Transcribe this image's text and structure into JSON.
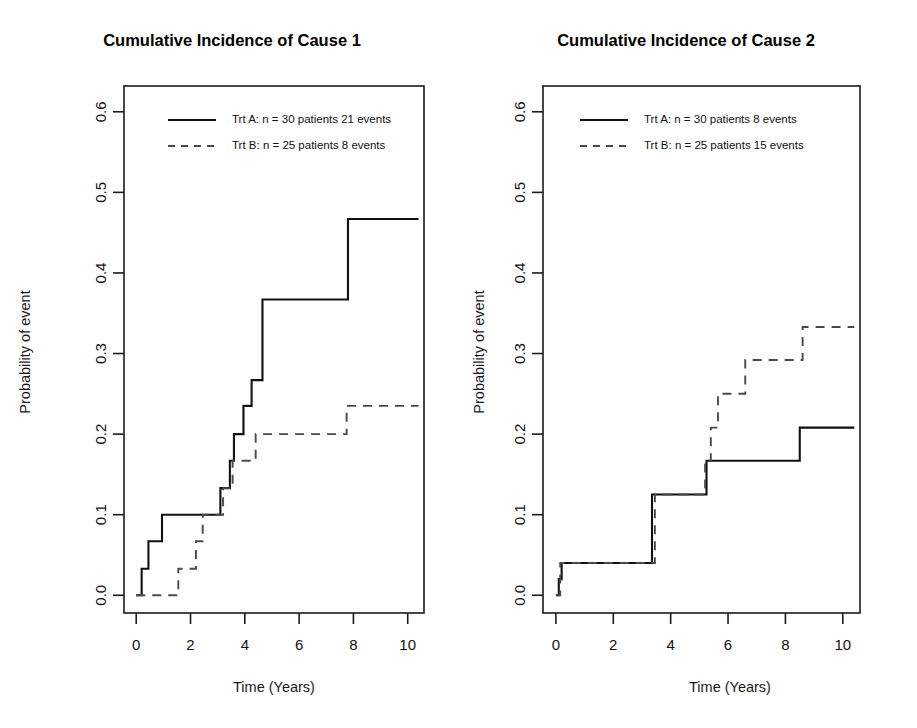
{
  "figure": {
    "width": 917,
    "height": 728,
    "background": "#ffffff",
    "ink_color": "#111111",
    "dashed_color": "#4a4a4a"
  },
  "chart_data": [
    {
      "type": "line",
      "step": "hv",
      "panel": "left",
      "title": "Cumulative Incidence of Cause 1",
      "xlabel": "Time (Years)",
      "ylabel": "Probability of event",
      "xlim": [
        -0.45,
        10.6
      ],
      "ylim": [
        -0.022,
        0.632
      ],
      "xticks": [
        0,
        2,
        4,
        6,
        8,
        10
      ],
      "xticklabels": [
        "0",
        "2",
        "4",
        "6",
        "8",
        "10"
      ],
      "yticks": [
        0.0,
        0.1,
        0.2,
        0.3,
        0.4,
        0.5,
        0.6
      ],
      "yticklabels": [
        "0.0",
        "0.1",
        "0.2",
        "0.3",
        "0.4",
        "0.5",
        "0.6"
      ],
      "grid": false,
      "legend_position": "top-left",
      "series": [
        {
          "name": "Trt A",
          "label": "Trt A: n = 30 patients 21 events",
          "style": "solid",
          "x": [
            0.0,
            0.2,
            0.45,
            0.95,
            2.45,
            3.1,
            3.45,
            3.6,
            3.95,
            4.25,
            4.65,
            7.55,
            7.8,
            10.4
          ],
          "y": [
            0.0,
            0.033,
            0.067,
            0.1,
            0.1,
            0.133,
            0.167,
            0.2,
            0.235,
            0.267,
            0.367,
            0.367,
            0.467,
            0.467
          ]
        },
        {
          "name": "Trt B",
          "label": "Trt B: n = 25 patients 8 events",
          "style": "dashed",
          "x": [
            0.0,
            1.2,
            1.55,
            2.2,
            2.45,
            3.2,
            3.55,
            4.4,
            7.75,
            10.4
          ],
          "y": [
            0.0,
            0.0,
            0.033,
            0.067,
            0.1,
            0.133,
            0.167,
            0.2,
            0.235,
            0.235
          ]
        }
      ]
    },
    {
      "type": "line",
      "step": "hv",
      "panel": "right",
      "title": "Cumulative Incidence of Cause 2",
      "xlabel": "Time (Years)",
      "ylabel": "Probability of event",
      "xlim": [
        -0.45,
        10.6
      ],
      "ylim": [
        -0.022,
        0.632
      ],
      "xticks": [
        0,
        2,
        4,
        6,
        8,
        10
      ],
      "xticklabels": [
        "0",
        "2",
        "4",
        "6",
        "8",
        "10"
      ],
      "yticks": [
        0.0,
        0.1,
        0.2,
        0.3,
        0.4,
        0.5,
        0.6
      ],
      "yticklabels": [
        "0.0",
        "0.1",
        "0.2",
        "0.3",
        "0.4",
        "0.5",
        "0.6"
      ],
      "grid": false,
      "legend_position": "top-left",
      "series": [
        {
          "name": "Trt A",
          "label": "Trt A: n = 30 patients 8 events",
          "style": "solid",
          "x": [
            0.0,
            0.1,
            0.2,
            3.2,
            3.35,
            5.25,
            8.5,
            10.4
          ],
          "y": [
            0.0,
            0.02,
            0.04,
            0.04,
            0.125,
            0.167,
            0.208,
            0.208
          ]
        },
        {
          "name": "Trt B",
          "label": "Trt B: n = 25 patients 15 events",
          "style": "dashed",
          "x": [
            0.0,
            0.15,
            3.3,
            3.45,
            5.2,
            5.4,
            5.65,
            6.2,
            6.6,
            8.45,
            8.6,
            10.4
          ],
          "y": [
            0.0,
            0.04,
            0.04,
            0.125,
            0.167,
            0.208,
            0.25,
            0.25,
            0.292,
            0.292,
            0.333,
            0.333
          ]
        }
      ]
    }
  ]
}
